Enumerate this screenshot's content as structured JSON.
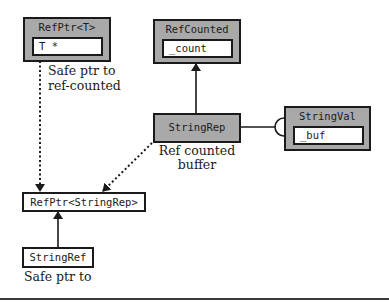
{
  "diagram": {
    "nodes": {
      "refptr_t": {
        "title": "RefPtr<T>",
        "field": "T *"
      },
      "refcounted": {
        "title": "RefCounted",
        "field": "_count"
      },
      "stringrep": {
        "title": "StringRep"
      },
      "stringval": {
        "title": "StringVal",
        "field": "_buf"
      },
      "refptr_stringrep": {
        "title": "RefPtr<StringRep>"
      },
      "stringref": {
        "title": "StringRef"
      }
    },
    "captions": {
      "refptr_t": [
        "Safe ptr to",
        "ref-counted"
      ],
      "stringrep": [
        "Ref counted",
        "buffer"
      ],
      "stringref": [
        "Safe ptr to"
      ]
    },
    "edges": [
      {
        "from": "RefPtr<T>",
        "to": "RefPtr<StringRep>",
        "style": "dotted",
        "arrow": "filled"
      },
      {
        "from": "StringRep",
        "to": "RefPtr<StringRep>",
        "style": "dotted",
        "arrow": "filled"
      },
      {
        "from": "StringRep",
        "to": "RefCounted",
        "style": "solid",
        "arrow": "filled"
      },
      {
        "from": "StringRep",
        "to": "StringVal",
        "style": "solid",
        "arrow": "half-circle"
      },
      {
        "from": "StringRef",
        "to": "RefPtr<StringRep>",
        "style": "solid",
        "arrow": "filled"
      }
    ],
    "colors": {
      "class_fill": "#a9a9a9",
      "field_fill": "#ffffff",
      "stroke": "#1a1a1a"
    }
  }
}
